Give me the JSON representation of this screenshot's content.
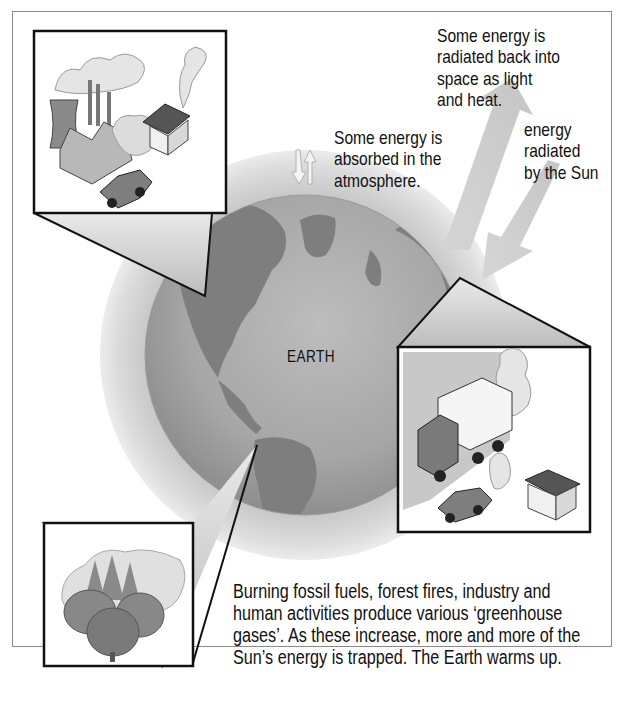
{
  "diagram": {
    "earth_label": "EARTH",
    "annotations": {
      "radiated_back": "Some energy is radiated back into space as light and heat.",
      "radiated_back_lines": [
        "Some energy is",
        "radiated back into",
        "space as light",
        "and heat."
      ],
      "sun_energy_lines": [
        "energy",
        "radiated",
        "by the Sun"
      ],
      "absorbed_lines": [
        "Some energy is",
        "absorbed in the",
        "atmosphere."
      ]
    },
    "caption_lines": [
      "Burning fossil fuels, forest fires, industry and",
      "human activities produce various ‘greenhouse",
      "gases’. As these increase, more and more of the",
      "Sun’s energy is trapped. The Earth warms up."
    ],
    "insets": [
      {
        "name": "industry",
        "depicts": [
          "cooling-tower",
          "factory-chimneys",
          "smoke",
          "house",
          "car"
        ]
      },
      {
        "name": "transport",
        "depicts": [
          "truck",
          "car",
          "house",
          "smoke"
        ]
      },
      {
        "name": "forest-fire",
        "depicts": [
          "trees",
          "smoke",
          "flames"
        ]
      }
    ],
    "colors": {
      "background": "#ffffff",
      "frame": "#8a8a8a",
      "ocean": "#a9a9a9",
      "land": "#7e7e7e",
      "atmosphere": "#d6d6d6",
      "arrow": "#c9c9c9",
      "text": "#1a1a1a"
    }
  }
}
